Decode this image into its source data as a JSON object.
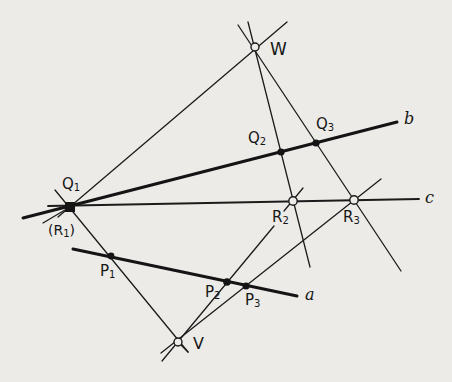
{
  "figure": {
    "lines": [
      {
        "id": "a",
        "label": "a",
        "from": [
          73,
          249
        ],
        "to": [
          297,
          296
        ],
        "weight": "thick"
      },
      {
        "id": "b",
        "label": "b",
        "from": [
          23,
          218
        ],
        "to": [
          397,
          122
        ],
        "weight": "thick"
      },
      {
        "id": "c",
        "label": "c",
        "from": [
          48,
          206
        ],
        "to": [
          419,
          199
        ],
        "weight": "thin"
      },
      {
        "id": "W-Q1",
        "from": [
          287,
          22
        ],
        "to": [
          58,
          217
        ],
        "weight": "thin"
      },
      {
        "id": "W-Q2-R2",
        "from": [
          248,
          22
        ],
        "to": [
          310,
          267
        ],
        "weight": "thin"
      },
      {
        "id": "W-Q3-R3",
        "from": [
          238,
          25
        ],
        "to": [
          401,
          271
        ],
        "weight": "thin"
      },
      {
        "id": "Q1-P1-V",
        "from": [
          55,
          190
        ],
        "to": [
          188,
          352
        ],
        "weight": "thin"
      },
      {
        "id": "V-P2",
        "from": [
          162,
          361
        ],
        "to": [
          274,
          226
        ],
        "weight": "thin"
      },
      {
        "id": "V-P3-R3",
        "from": [
          161,
          353
        ],
        "to": [
          381,
          179
        ],
        "weight": "thin"
      },
      {
        "id": "R2-stub",
        "from": [
          284,
          211
        ],
        "to": [
          303,
          188
        ],
        "weight": "thin"
      },
      {
        "id": "Q1-stub",
        "from": [
          70,
          207
        ],
        "to": [
          43,
          223
        ],
        "weight": "thin"
      }
    ],
    "points": [
      {
        "id": "W",
        "label": "W",
        "x": 255,
        "y": 47,
        "style": "open"
      },
      {
        "id": "Q1",
        "label": "Q",
        "sub": "1",
        "x": 70,
        "y": 207,
        "style": "filled-square"
      },
      {
        "id": "Q2",
        "label": "Q",
        "sub": "2",
        "x": 281,
        "y": 152,
        "style": "filled"
      },
      {
        "id": "Q3",
        "label": "Q",
        "sub": "3",
        "x": 316,
        "y": 143,
        "style": "filled"
      },
      {
        "id": "R2",
        "label": "R",
        "sub": "2",
        "x": 293,
        "y": 201,
        "style": "open"
      },
      {
        "id": "R3",
        "label": "R",
        "sub": "3",
        "x": 354,
        "y": 200,
        "style": "open"
      },
      {
        "id": "P1",
        "label": "P",
        "sub": "1",
        "x": 111,
        "y": 256,
        "style": "filled"
      },
      {
        "id": "P2",
        "label": "P",
        "sub": "2",
        "x": 227,
        "y": 282,
        "style": "filled"
      },
      {
        "id": "P3",
        "label": "P",
        "sub": "3",
        "x": 246,
        "y": 286,
        "style": "filled"
      },
      {
        "id": "V",
        "label": "V",
        "x": 178,
        "y": 342,
        "style": "open"
      }
    ]
  },
  "labels": {
    "W": "W",
    "Q1": {
      "main": "Q",
      "sub": "1"
    },
    "Q2": {
      "main": "Q",
      "sub": "2"
    },
    "Q3": {
      "main": "Q",
      "sub": "3"
    },
    "R1": {
      "prefix": "(R",
      "sub": "1",
      "suffix": ")"
    },
    "R2": {
      "main": "R",
      "sub": "2"
    },
    "R3": {
      "main": "R",
      "sub": "3"
    },
    "P1": {
      "main": "P",
      "sub": "1"
    },
    "P2": {
      "main": "P",
      "sub": "2"
    },
    "P3": {
      "main": "P",
      "sub": "3"
    },
    "V": "V",
    "line_a": "a",
    "line_b": "b",
    "line_c": "c"
  }
}
